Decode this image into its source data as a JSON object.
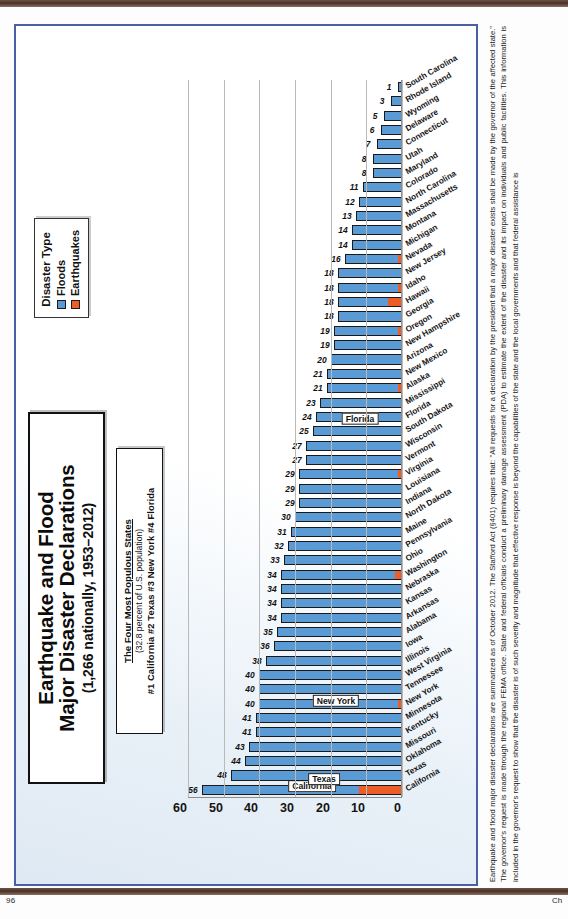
{
  "page": {
    "page_number": "96",
    "chapter_mark": "Ch"
  },
  "figure": {
    "title_line1": "Earthquake and Flood",
    "title_line2": "Major Disaster Declarations",
    "title_sub": "(1,266 nationally, 1953–2012)",
    "note_box": {
      "heading": "The Four Most Populous States",
      "subheading": "(32.8 percent of U.S. population)",
      "ranking": "#1 California  #2 Texas  #3 New York  #4 Florida"
    },
    "legend": {
      "title": "Disaster Type",
      "items": [
        {
          "label": "Floods",
          "color": "#5b9bd5"
        },
        {
          "label": "Earthquakes",
          "color": "#ed5d28"
        }
      ]
    },
    "callouts": [
      "California",
      "Texas",
      "New York",
      "Florida"
    ],
    "caption": "Earthquake and flood major disaster declarations are summarized as of October 2012. The Stafford Act (§401) requires that: \"All requests for a declaration by the president that a major disaster exists shall be made by the governor of the affected state.\" The governor's request is made through the regional FEMA office. State and federal officials conduct a preliminary damage assessment (PDA) to estimate the extent of the disaster and its impact on individuals and public facilities. This information is included in the governor's request to show that the disaster is of such severity and magnitude that effective response is beyond the capabilities of the state and the local governments and that federal assistance is"
  },
  "chart_data": {
    "type": "bar",
    "orientation": "horizontal",
    "title": "Earthquake and Flood Major Disaster Declarations (1,266 nationally, 1953–2012)",
    "xlabel": "",
    "ylabel": "number of declarations",
    "ylim": [
      0,
      60
    ],
    "yticks": [
      0,
      10,
      20,
      30,
      40,
      50,
      60
    ],
    "grid": true,
    "legend_position": "top-right",
    "categories": [
      "California",
      "Texas",
      "Oklahoma",
      "Missouri",
      "Kentucky",
      "Minnesota",
      "New York",
      "Tennessee",
      "West Virginia",
      "Illinois",
      "Iowa",
      "Alabama",
      "Arkansas",
      "Kansas",
      "Nebraska",
      "Washington",
      "Ohio",
      "Pennsylvania",
      "Maine",
      "North Dakota",
      "Indiana",
      "Louisiana",
      "Virginia",
      "Vermont",
      "Wisconsin",
      "South Dakota",
      "Florida",
      "Mississippi",
      "Alaska",
      "New Mexico",
      "Arizona",
      "New Hampshire",
      "Oregon",
      "Georgia",
      "Hawaii",
      "Idaho",
      "New Jersey",
      "Nevada",
      "Michigan",
      "Montana",
      "Massachusetts",
      "North Carolina",
      "Colorado",
      "Maryland",
      "Utah",
      "Connecticut",
      "Delaware",
      "Wyoming",
      "Rhode Island",
      "South Carolina"
    ],
    "totals": [
      56,
      48,
      44,
      43,
      41,
      41,
      40,
      40,
      40,
      38,
      36,
      35,
      34,
      34,
      34,
      34,
      33,
      32,
      31,
      30,
      29,
      29,
      29,
      27,
      27,
      25,
      24,
      23,
      21,
      21,
      20,
      19,
      19,
      18,
      18,
      18,
      18,
      16,
      14,
      14,
      13,
      12,
      11,
      8,
      8,
      7,
      6,
      5,
      3,
      1
    ],
    "series": [
      {
        "name": "Floods",
        "color": "#5b9bd5",
        "values": [
          44,
          48,
          44,
          43,
          41,
          41,
          39,
          40,
          40,
          38,
          36,
          35,
          34,
          34,
          34,
          32,
          33,
          32,
          31,
          30,
          29,
          29,
          28,
          27,
          27,
          25,
          24,
          23,
          20,
          21,
          20,
          19,
          18,
          18,
          14,
          17,
          18,
          15,
          14,
          14,
          13,
          12,
          11,
          8,
          8,
          7,
          6,
          5,
          3,
          1
        ]
      },
      {
        "name": "Earthquakes",
        "color": "#ed5d28",
        "values": [
          12,
          0,
          0,
          0,
          0,
          0,
          1,
          0,
          0,
          0,
          0,
          0,
          0,
          0,
          0,
          2,
          0,
          0,
          0,
          0,
          0,
          0,
          1,
          0,
          0,
          0,
          0,
          0,
          1,
          0,
          0,
          0,
          1,
          0,
          4,
          1,
          0,
          1,
          0,
          0,
          0,
          0,
          0,
          0,
          0,
          0,
          0,
          0,
          0,
          0
        ]
      }
    ]
  }
}
